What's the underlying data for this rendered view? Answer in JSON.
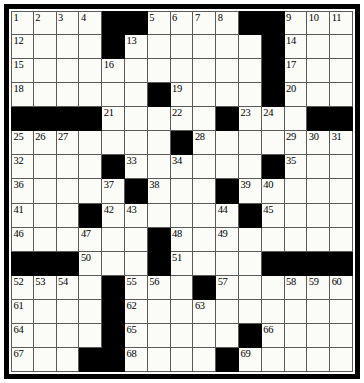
{
  "puzzle": {
    "title": "Crossword Puzzle Grid",
    "type": "crossword-grid",
    "rows": 15,
    "columns": 15,
    "block_color": "#000000",
    "cell_color": "#fbfbf8",
    "grid_line_color": "#5a5a5a",
    "frame_color": "#000000",
    "highest_clue_number": 69,
    "grid": [
      [
        "1",
        "2",
        "3",
        "4",
        "#",
        "#",
        "5",
        "6",
        "7",
        "8",
        "#",
        "#",
        "9",
        "10",
        "11"
      ],
      [
        "12",
        "",
        "",
        "",
        "#",
        "13",
        "",
        "",
        "",
        "",
        "",
        "#",
        "14",
        "",
        ""
      ],
      [
        "15",
        "",
        "",
        "",
        "16",
        "",
        "",
        "",
        "",
        "",
        "",
        "#",
        "17",
        "",
        ""
      ],
      [
        "18",
        "",
        "",
        "",
        "",
        "",
        "#",
        "19",
        "",
        "",
        "",
        "#",
        "20",
        "",
        ""
      ],
      [
        "#",
        "#",
        "#",
        "#",
        "21",
        "",
        "",
        "22",
        "",
        "#",
        "23",
        "24",
        "",
        "#",
        "#"
      ],
      [
        "25",
        "26",
        "27",
        "",
        "",
        "",
        "",
        "#",
        "28",
        "",
        "",
        "",
        "29",
        "30",
        "31"
      ],
      [
        "32",
        "",
        "",
        "",
        "#",
        "33",
        "",
        "34",
        "",
        "",
        "",
        "#",
        "35",
        "",
        ""
      ],
      [
        "36",
        "",
        "",
        "",
        "37",
        "#",
        "38",
        "",
        "",
        "#",
        "39",
        "40",
        "",
        "",
        ""
      ],
      [
        "41",
        "",
        "",
        "#",
        "42",
        "43",
        "",
        "",
        "",
        "44",
        "#",
        "45",
        "",
        "",
        ""
      ],
      [
        "46",
        "",
        "",
        "47",
        "",
        "",
        "#",
        "48",
        "",
        "49",
        "",
        "",
        "",
        "",
        ""
      ],
      [
        "#",
        "#",
        "#",
        "50",
        "",
        "",
        "#",
        "51",
        "",
        "",
        "",
        "#",
        "#",
        "#",
        "#"
      ],
      [
        "52",
        "53",
        "54",
        "",
        "#",
        "55",
        "56",
        "",
        "#",
        "57",
        "",
        "",
        "58",
        "59",
        "60"
      ],
      [
        "61",
        "",
        "",
        "",
        "#",
        "62",
        "",
        "",
        "63",
        "",
        "",
        "",
        "",
        "",
        ""
      ],
      [
        "64",
        "",
        "",
        "",
        "#",
        "65",
        "",
        "",
        "",
        "",
        "#",
        "66",
        "",
        "",
        ""
      ],
      [
        "67",
        "",
        "",
        "#",
        "#",
        "68",
        "",
        "",
        "",
        "#",
        "69",
        "",
        "",
        "",
        ""
      ]
    ],
    "blocks": [
      [
        0,
        4
      ],
      [
        0,
        5
      ],
      [
        0,
        10
      ],
      [
        0,
        11
      ],
      [
        1,
        4
      ],
      [
        1,
        11
      ],
      [
        2,
        11
      ],
      [
        3,
        6
      ],
      [
        3,
        11
      ],
      [
        4,
        0
      ],
      [
        4,
        1
      ],
      [
        4,
        2
      ],
      [
        4,
        3
      ],
      [
        4,
        9
      ],
      [
        4,
        13
      ],
      [
        4,
        14
      ],
      [
        5,
        7
      ],
      [
        6,
        4
      ],
      [
        6,
        11
      ],
      [
        7,
        5
      ],
      [
        7,
        9
      ],
      [
        8,
        3
      ],
      [
        8,
        10
      ],
      [
        9,
        6
      ],
      [
        10,
        0
      ],
      [
        10,
        1
      ],
      [
        10,
        2
      ],
      [
        10,
        6
      ],
      [
        10,
        11
      ],
      [
        10,
        12
      ],
      [
        10,
        13
      ],
      [
        10,
        14
      ],
      [
        11,
        4
      ],
      [
        11,
        8
      ],
      [
        12,
        4
      ],
      [
        13,
        4
      ],
      [
        13,
        10
      ],
      [
        14,
        3
      ],
      [
        14,
        4
      ],
      [
        14,
        9
      ]
    ],
    "numbered_cells": [
      {
        "number": "1",
        "row": 0,
        "col": 0
      },
      {
        "number": "2",
        "row": 0,
        "col": 1
      },
      {
        "number": "3",
        "row": 0,
        "col": 2
      },
      {
        "number": "4",
        "row": 0,
        "col": 3
      },
      {
        "number": "5",
        "row": 0,
        "col": 6
      },
      {
        "number": "6",
        "row": 0,
        "col": 7
      },
      {
        "number": "7",
        "row": 0,
        "col": 8
      },
      {
        "number": "8",
        "row": 0,
        "col": 9
      },
      {
        "number": "9",
        "row": 0,
        "col": 12
      },
      {
        "number": "10",
        "row": 0,
        "col": 13
      },
      {
        "number": "11",
        "row": 0,
        "col": 14
      },
      {
        "number": "12",
        "row": 1,
        "col": 0
      },
      {
        "number": "13",
        "row": 1,
        "col": 5
      },
      {
        "number": "14",
        "row": 1,
        "col": 12
      },
      {
        "number": "15",
        "row": 2,
        "col": 0
      },
      {
        "number": "16",
        "row": 2,
        "col": 4
      },
      {
        "number": "17",
        "row": 2,
        "col": 12
      },
      {
        "number": "18",
        "row": 3,
        "col": 0
      },
      {
        "number": "19",
        "row": 3,
        "col": 7
      },
      {
        "number": "20",
        "row": 3,
        "col": 12
      },
      {
        "number": "21",
        "row": 4,
        "col": 4
      },
      {
        "number": "22",
        "row": 4,
        "col": 7
      },
      {
        "number": "23",
        "row": 4,
        "col": 10
      },
      {
        "number": "24",
        "row": 4,
        "col": 11
      },
      {
        "number": "25",
        "row": 5,
        "col": 0
      },
      {
        "number": "26",
        "row": 5,
        "col": 1
      },
      {
        "number": "27",
        "row": 5,
        "col": 2
      },
      {
        "number": "28",
        "row": 5,
        "col": 8
      },
      {
        "number": "29",
        "row": 5,
        "col": 12
      },
      {
        "number": "30",
        "row": 5,
        "col": 13
      },
      {
        "number": "31",
        "row": 5,
        "col": 14
      },
      {
        "number": "32",
        "row": 6,
        "col": 0
      },
      {
        "number": "33",
        "row": 6,
        "col": 5
      },
      {
        "number": "34",
        "row": 6,
        "col": 7
      },
      {
        "number": "35",
        "row": 6,
        "col": 12
      },
      {
        "number": "36",
        "row": 7,
        "col": 0
      },
      {
        "number": "37",
        "row": 7,
        "col": 4
      },
      {
        "number": "38",
        "row": 7,
        "col": 6
      },
      {
        "number": "39",
        "row": 7,
        "col": 10
      },
      {
        "number": "40",
        "row": 7,
        "col": 11
      },
      {
        "number": "41",
        "row": 8,
        "col": 0
      },
      {
        "number": "42",
        "row": 8,
        "col": 4
      },
      {
        "number": "43",
        "row": 8,
        "col": 5
      },
      {
        "number": "44",
        "row": 8,
        "col": 9
      },
      {
        "number": "45",
        "row": 8,
        "col": 11
      },
      {
        "number": "46",
        "row": 9,
        "col": 0
      },
      {
        "number": "47",
        "row": 9,
        "col": 3
      },
      {
        "number": "48",
        "row": 9,
        "col": 7
      },
      {
        "number": "49",
        "row": 9,
        "col": 9
      },
      {
        "number": "50",
        "row": 10,
        "col": 3
      },
      {
        "number": "51",
        "row": 10,
        "col": 7
      },
      {
        "number": "52",
        "row": 11,
        "col": 0
      },
      {
        "number": "53",
        "row": 11,
        "col": 1
      },
      {
        "number": "54",
        "row": 11,
        "col": 2
      },
      {
        "number": "55",
        "row": 11,
        "col": 5
      },
      {
        "number": "56",
        "row": 11,
        "col": 6
      },
      {
        "number": "57",
        "row": 11,
        "col": 9
      },
      {
        "number": "58",
        "row": 11,
        "col": 12
      },
      {
        "number": "59",
        "row": 11,
        "col": 13
      },
      {
        "number": "60",
        "row": 11,
        "col": 14
      },
      {
        "number": "61",
        "row": 12,
        "col": 0
      },
      {
        "number": "62",
        "row": 12,
        "col": 5
      },
      {
        "number": "63",
        "row": 12,
        "col": 8
      },
      {
        "number": "64",
        "row": 13,
        "col": 0
      },
      {
        "number": "65",
        "row": 13,
        "col": 5
      },
      {
        "number": "66",
        "row": 13,
        "col": 11
      },
      {
        "number": "67",
        "row": 14,
        "col": 0
      },
      {
        "number": "68",
        "row": 14,
        "col": 5
      },
      {
        "number": "69",
        "row": 14,
        "col": 10
      }
    ]
  }
}
